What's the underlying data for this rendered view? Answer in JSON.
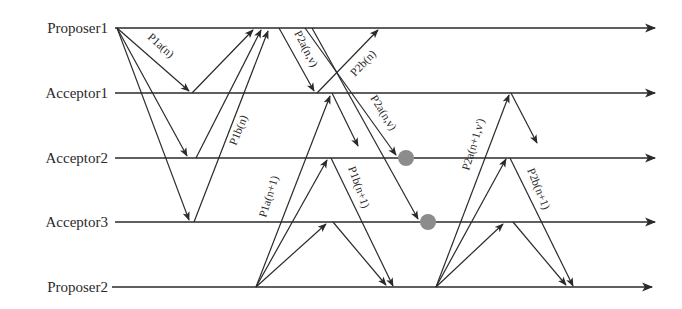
{
  "diagram": {
    "type": "paxos-sequence-diagram",
    "lanes": [
      {
        "id": "proposer1",
        "label": "Proposer1",
        "y": 28
      },
      {
        "id": "acceptor1",
        "label": "Acceptor1",
        "y": 93
      },
      {
        "id": "acceptor2",
        "label": "Acceptor2",
        "y": 158
      },
      {
        "id": "acceptor3",
        "label": "Acceptor3",
        "y": 222
      },
      {
        "id": "proposer2",
        "label": "Proposer2",
        "y": 287
      }
    ],
    "labels": {
      "p1a_n": "P1a(n)",
      "p1b_n": "P1b(n)",
      "p2a_nv_1": "P2a(n,v)",
      "p2b_n": "P2b(n)",
      "p2a_nv_2": "P2a(n,v)",
      "p1a_n1": "P1a(n+1)",
      "p1b_n1": "P1b(n+1)",
      "p2a_n1v": "P2a(n+1,v')",
      "p2b_n1": "P2b(n+1)"
    },
    "messages": [
      {
        "from": "Proposer1",
        "to": "Acceptor1",
        "label": "P1a(n)"
      },
      {
        "from": "Proposer1",
        "to": "Acceptor2",
        "label": "P1a(n)"
      },
      {
        "from": "Proposer1",
        "to": "Acceptor3",
        "label": "P1a(n)"
      },
      {
        "from": "Acceptor1",
        "to": "Proposer1",
        "label": "P1b(n)"
      },
      {
        "from": "Acceptor2",
        "to": "Proposer1",
        "label": "P1b(n)"
      },
      {
        "from": "Acceptor3",
        "to": "Proposer1",
        "label": "P1b(n)"
      },
      {
        "from": "Proposer1",
        "to": "Acceptor1",
        "label": "P2a(n,v)"
      },
      {
        "from": "Acceptor1",
        "to": "Proposer1",
        "label": "P2b(n)"
      },
      {
        "from": "Proposer1",
        "to": "Acceptor2",
        "label": "P2a(n,v)",
        "lost": true
      },
      {
        "from": "Proposer1",
        "to": "Acceptor3",
        "label": "P2a(n,v)",
        "lost": true
      },
      {
        "from": "Proposer2",
        "to": "Acceptor1",
        "label": "P1a(n+1)"
      },
      {
        "from": "Proposer2",
        "to": "Acceptor2",
        "label": "P1a(n+1)"
      },
      {
        "from": "Proposer2",
        "to": "Acceptor3",
        "label": "P1a(n+1)"
      },
      {
        "from": "Acceptor1",
        "to": "Acceptor2",
        "label": "P1b(n+1)"
      },
      {
        "from": "Acceptor2",
        "to": "Proposer2",
        "label": "P1b(n+1)"
      },
      {
        "from": "Acceptor3",
        "to": "Proposer2",
        "label": "P1b(n+1)"
      },
      {
        "from": "Proposer2",
        "to": "Proposer1",
        "label": "P2a(n+1,v')"
      },
      {
        "from": "Proposer2",
        "to": "Acceptor2",
        "label": "P2a(n+1,v')"
      },
      {
        "from": "Proposer2",
        "to": "Acceptor3",
        "label": "P2a(n+1,v')"
      },
      {
        "from": "Proposer1",
        "to": "Acceptor1",
        "label": "P2b(n+1)"
      },
      {
        "from": "Acceptor2",
        "to": "Proposer2",
        "label": "P2b(n+1)"
      },
      {
        "from": "Acceptor3",
        "to": "Proposer2",
        "label": "P2b(n+1)"
      }
    ],
    "colors": {
      "ink": "#2a2a2a",
      "lost_message_marker": "#8c8c8c",
      "background": "#ffffff"
    }
  }
}
